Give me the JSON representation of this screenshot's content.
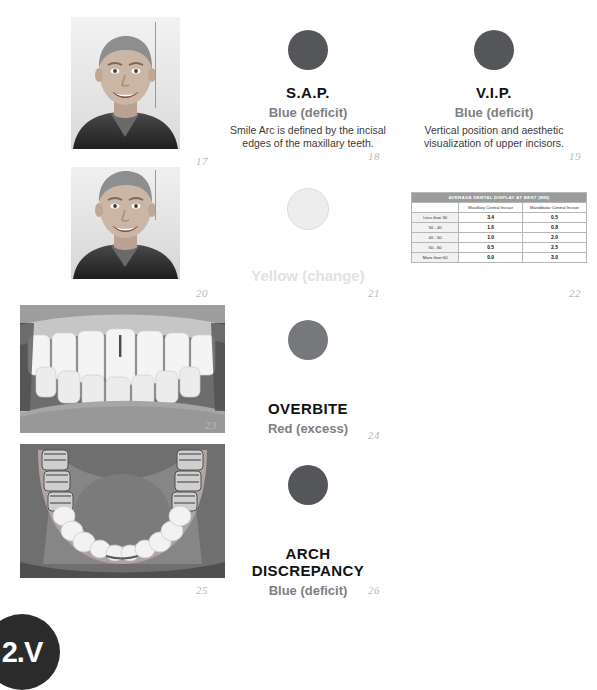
{
  "page": {
    "background": "#ffffff",
    "corner_badge": {
      "text": "2.V",
      "color": "#2b2b2b"
    }
  },
  "figures": [
    {
      "number": "17"
    },
    {
      "number": "18"
    },
    {
      "number": "19"
    },
    {
      "number": "20"
    },
    {
      "number": "21"
    },
    {
      "number": "22"
    },
    {
      "number": "23"
    },
    {
      "number": "24"
    },
    {
      "number": "25"
    },
    {
      "number": "26"
    }
  ],
  "photos": [
    {
      "name": "portrait-smiling-man-upper",
      "caption_number": "17",
      "type": "portrait"
    },
    {
      "name": "portrait-smiling-man-lower",
      "caption_number": "20",
      "type": "portrait"
    },
    {
      "name": "intraoral-frontal-teeth",
      "caption_number": "23",
      "type": "intraoral"
    },
    {
      "name": "occlusal-lower-arch",
      "caption_number": "25",
      "type": "occlusal"
    }
  ],
  "concepts": [
    {
      "id": "sap",
      "title": "S.A.P.",
      "subtitle": "Blue (deficit)",
      "description": "Smile Arc is defined by the incisal edges of the maxillary teeth.",
      "dot_color": "#55565a",
      "dot_style": "dark",
      "figure": "18"
    },
    {
      "id": "vip",
      "title": "V.I.P.",
      "subtitle": "Blue (deficit)",
      "description": "Vertical position and aesthetic visualization of upper incisors.",
      "dot_color": "#55565a",
      "dot_style": "dark",
      "figure": "19"
    },
    {
      "id": "yellow-change",
      "title": "",
      "subtitle": "Yellow (change)",
      "description": "",
      "dot_color": "#ededed",
      "dot_style": "pale",
      "figure": "21"
    },
    {
      "id": "overbite",
      "title": "OVERBITE",
      "subtitle": "Red (excess)",
      "description": "",
      "dot_color": "#77787c",
      "dot_style": "grey",
      "figure": "24"
    },
    {
      "id": "arch-discrepancy",
      "title": "ARCH DISCREPANCY",
      "title_line1": "ARCH",
      "title_line2": "DISCREPANCY",
      "subtitle": "Blue (deficit)",
      "description": "",
      "dot_color": "#55565a",
      "dot_style": "dark",
      "figure": "26"
    }
  ],
  "table": {
    "figure": "22",
    "banner": "AVERAGE DENTAL DISPLAY AT BEST (MM)",
    "columns": [
      "",
      "Maxillary Central Incisor",
      "Mandibular Central Incisor"
    ],
    "rows": [
      {
        "label": "Less than 30",
        "maxillary": "3.4",
        "mandibular": "0.5"
      },
      {
        "label": "30 - 40",
        "maxillary": "1.6",
        "mandibular": "0.8"
      },
      {
        "label": "40 - 50",
        "maxillary": "1.0",
        "mandibular": "2.0"
      },
      {
        "label": "50 - 60",
        "maxillary": "0.5",
        "mandibular": "2.5"
      },
      {
        "label": "More than 60",
        "maxillary": "0.0",
        "mandibular": "3.0"
      }
    ]
  }
}
